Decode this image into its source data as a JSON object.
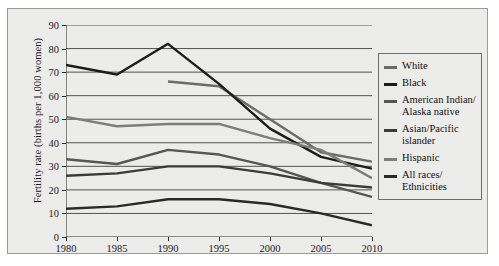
{
  "chart_data": {
    "type": "line",
    "title": "",
    "xlabel": "",
    "ylabel": "Fertility rate (births per 1,000 women)",
    "x": [
      1980,
      1985,
      1990,
      1995,
      2000,
      2005,
      2010
    ],
    "xlim": [
      1980,
      2010
    ],
    "ylim": [
      0,
      90
    ],
    "ytick_step": 10,
    "yticks": [
      0,
      10,
      20,
      30,
      40,
      50,
      60,
      70,
      80,
      90
    ],
    "xticks": [
      "1980",
      "1985",
      "1990",
      "1995",
      "2000",
      "2005",
      "2010"
    ],
    "grid": "horizontal",
    "legend_position": "right-outside",
    "background_color": "#ececeb",
    "series": [
      {
        "name": "White",
        "color": "#6b6b6b",
        "x": [
          1990,
          1995,
          2000,
          2005,
          2010
        ],
        "values": [
          66,
          64,
          50,
          36,
          32
        ]
      },
      {
        "name": "Black",
        "color": "#1c1c1c",
        "x": [
          1980,
          1985,
          1990,
          1995,
          2000,
          2005,
          2010
        ],
        "values": [
          73,
          69,
          82,
          65,
          46,
          34,
          29
        ]
      },
      {
        "name": "American Indian/\nAlaska native",
        "color": "#565656",
        "x": [
          1980,
          1985,
          1990,
          1995,
          2000,
          2005,
          2010
        ],
        "values": [
          33,
          31,
          37,
          35,
          30,
          23,
          17
        ]
      },
      {
        "name": "Asian/Pacific\nislander",
        "color": "#3b3b3b",
        "x": [
          1980,
          1985,
          1990,
          1995,
          2000,
          2005,
          2010
        ],
        "values": [
          26,
          27,
          30,
          30,
          27,
          23,
          21
        ]
      },
      {
        "name": "Hispanic",
        "color": "#7d7d7d",
        "x": [
          1980,
          1985,
          1990,
          1995,
          2000,
          2005,
          2010
        ],
        "values": [
          51,
          47,
          48,
          48,
          42,
          37,
          25
        ]
      },
      {
        "name": "All races/\nEthnicities",
        "color": "#2a2a2a",
        "x": [
          1980,
          1985,
          1990,
          1995,
          2000,
          2005,
          2010
        ],
        "values": [
          12,
          13,
          16,
          16,
          14,
          10,
          5
        ]
      }
    ]
  },
  "legend": {
    "items": [
      {
        "label": "White",
        "color": "#6b6b6b"
      },
      {
        "label": "Black",
        "color": "#1c1c1c"
      },
      {
        "label": "American Indian/\nAlaska native",
        "color": "#565656"
      },
      {
        "label": "Asian/Pacific\nislander",
        "color": "#3b3b3b"
      },
      {
        "label": "Hispanic",
        "color": "#7d7d7d"
      },
      {
        "label": "All races/\nEthnicities",
        "color": "#2a2a2a"
      }
    ]
  }
}
